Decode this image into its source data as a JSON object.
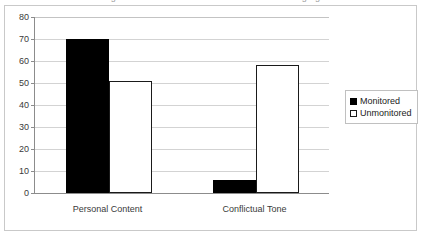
{
  "frame": {
    "border_color": "#c9c9c9",
    "background": "#ffffff",
    "clipped_title_remnant": "Figure: Monitored versus Unmonitored messaging"
  },
  "legend": {
    "position": "right",
    "entries": [
      {
        "label": "Monitored",
        "swatch": "filled-black-square",
        "color": "#000000"
      },
      {
        "label": "Unmonitored",
        "swatch": "hollow-white-square",
        "color": "#ffffff"
      }
    ]
  },
  "axis": {
    "y_ticks": [
      "0",
      "10",
      "20",
      "30",
      "40",
      "50",
      "60",
      "70",
      "80"
    ],
    "x_categories": [
      "Personal Content",
      "Conflictual Tone"
    ]
  },
  "chart_data": {
    "type": "bar",
    "title": "",
    "subtitle": "",
    "xlabel": "",
    "ylabel": "",
    "categories": [
      "Personal Content",
      "Conflictual Tone"
    ],
    "series": [
      {
        "name": "Monitored",
        "values": [
          70,
          6
        ],
        "color": "#000000",
        "style": "solid-fill"
      },
      {
        "name": "Unmonitored",
        "values": [
          51,
          58
        ],
        "color": "#ffffff",
        "style": "outlined-white"
      }
    ],
    "ylim": [
      0,
      80
    ],
    "ytick_interval": 10,
    "ytick_labels": [
      "0",
      "10",
      "20",
      "30",
      "40",
      "50",
      "60",
      "70",
      "80"
    ],
    "grid": true,
    "grid_axis": "y",
    "grid_color": "#d3d3d3",
    "legend_position": "right",
    "bar_grouping": "grouped",
    "value_labels_shown": false
  }
}
